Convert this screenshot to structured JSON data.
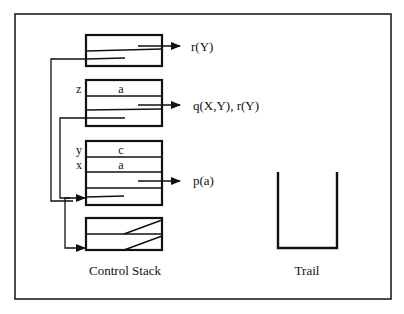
{
  "diagram": {
    "colors": {
      "ink": "#111111",
      "background": "#ffffff"
    },
    "control_stack": {
      "label": "Control Stack",
      "frames": [
        {
          "id": "frame-1",
          "goal": "r(Y)",
          "vars": []
        },
        {
          "id": "frame-2",
          "goal": "q(X,Y), r(Y)",
          "vars": [
            {
              "name": "z",
              "value": "a"
            }
          ]
        },
        {
          "id": "frame-3",
          "goal": "p(a)",
          "vars": [
            {
              "name": "y",
              "value": "c"
            },
            {
              "name": "x",
              "value": "a"
            }
          ]
        },
        {
          "id": "frame-4",
          "goal": "",
          "vars": []
        }
      ]
    },
    "trail": {
      "label": "Trail"
    }
  }
}
